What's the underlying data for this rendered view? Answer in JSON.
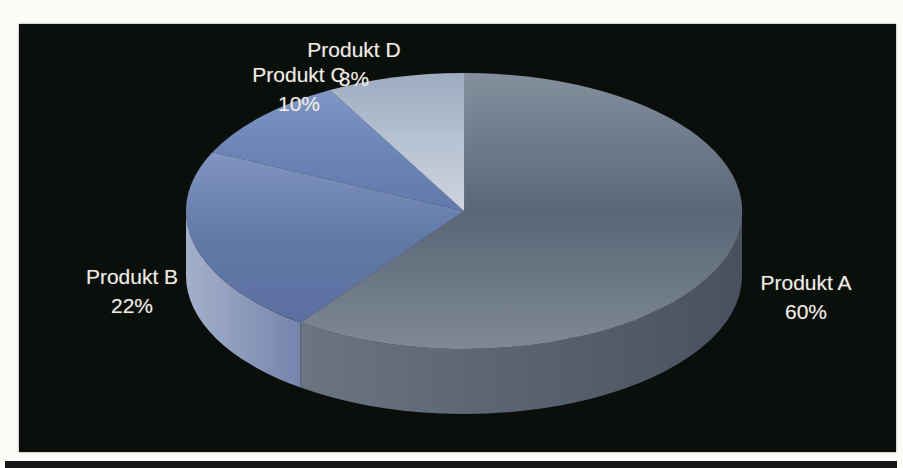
{
  "page": {
    "background_color": "#fbfbf8",
    "panel_color": "#0b0f0b",
    "strip_color": "#161616",
    "label_color": "#efece4"
  },
  "chart_data": {
    "type": "pie",
    "projection": "3d",
    "title": "",
    "legend": "none",
    "start_angle_deg": 0,
    "direction": "clockwise",
    "unit": "percent",
    "data_labels": "category name + percentage, outside slices",
    "background": "#0b0f0b",
    "categories": [
      "Produkt A",
      "Produkt B",
      "Produkt C",
      "Produkt D"
    ],
    "values": [
      60,
      22,
      10,
      8
    ],
    "slices": [
      {
        "label": "Produkt A",
        "pct": "60%",
        "value": 60,
        "top_gradient": [
          "#84909e",
          "#5a6675",
          "#7e8896"
        ],
        "side_gradient": [
          "#6b7483",
          "#495160"
        ]
      },
      {
        "label": "Produkt B",
        "pct": "22%",
        "value": 22,
        "top_gradient": [
          "#8095c1",
          "#6278a7",
          "#5b70a0"
        ],
        "side_gradient": [
          "#a4b0ca",
          "#7584ad"
        ]
      },
      {
        "label": "Produkt C",
        "pct": "10%",
        "value": 10,
        "top_gradient": [
          "#7f97c6",
          "#6d85b6",
          "#6179ab"
        ]
      },
      {
        "label": "Produkt D",
        "pct": "8%",
        "value": 8,
        "top_gradient": [
          "#9dacc0",
          "#b7c2d2",
          "#ccd4df"
        ]
      }
    ]
  }
}
